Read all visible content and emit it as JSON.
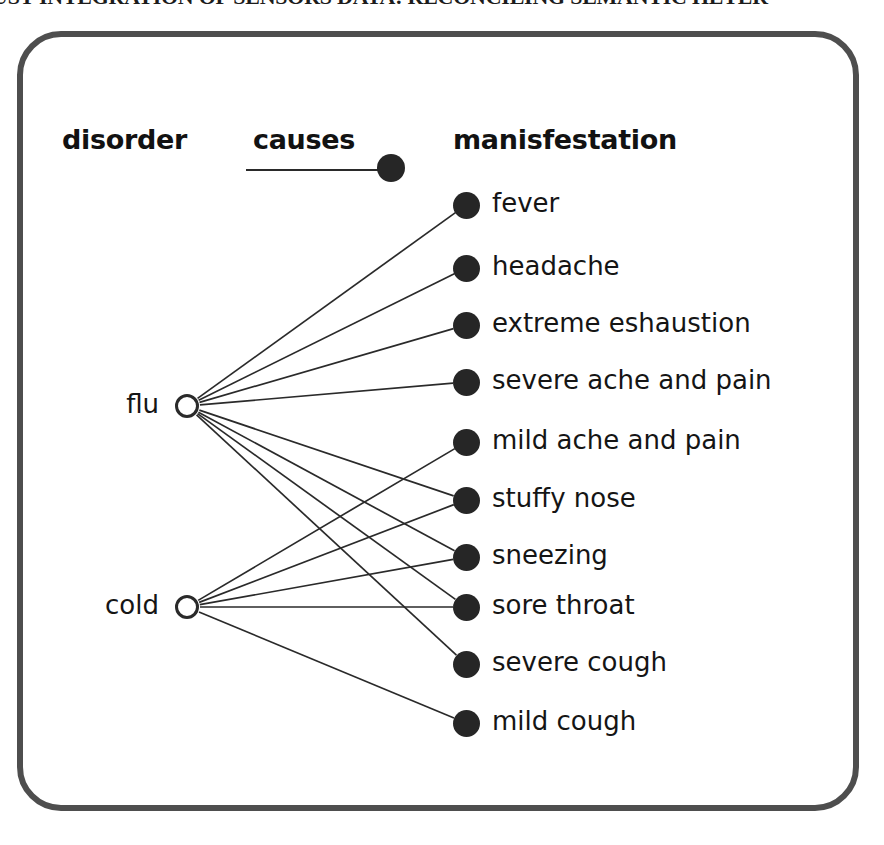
{
  "caption": {
    "text": "UST INTEGRATION OF SENSORS DATA: RECONCILING SEMANTIC HETER"
  },
  "figure": {
    "headers": {
      "disorder": "disorder",
      "causes": "causes",
      "manifestation": "manisfestation"
    },
    "legend": {
      "label": "causes",
      "edge_color": "#2a2a2a",
      "node_color": "#262626"
    },
    "colors": {
      "frame": "#4e4e4e",
      "edge": "#2a2a2a",
      "filled_node": "#262626",
      "hollow_node_stroke": "#2a2a2a",
      "text": "#151515",
      "background": "#ffffff"
    },
    "disorders": [
      {
        "id": "flu",
        "label": "flu",
        "x": 187,
        "y": 406
      },
      {
        "id": "cold",
        "label": "cold",
        "x": 187,
        "y": 607
      }
    ],
    "manifestations": [
      {
        "id": "fever",
        "label": "fever",
        "x": 466,
        "y": 205
      },
      {
        "id": "headache",
        "label": "headache",
        "x": 466,
        "y": 268
      },
      {
        "id": "extreme-eshaustion",
        "label": "extreme eshaustion",
        "x": 466,
        "y": 325
      },
      {
        "id": "severe-ache-and-pain",
        "label": "severe ache and pain",
        "x": 466,
        "y": 382
      },
      {
        "id": "mild-ache-and-pain",
        "label": "mild ache and pain",
        "x": 466,
        "y": 442
      },
      {
        "id": "stuffy-nose",
        "label": "stuffy nose",
        "x": 466,
        "y": 500
      },
      {
        "id": "sneezing",
        "label": "sneezing",
        "x": 466,
        "y": 557
      },
      {
        "id": "sore-throat",
        "label": "sore throat",
        "x": 466,
        "y": 607
      },
      {
        "id": "severe-cough",
        "label": "severe cough",
        "x": 466,
        "y": 664
      },
      {
        "id": "mild-cough",
        "label": "mild cough",
        "x": 466,
        "y": 723
      }
    ],
    "edges": [
      {
        "from": "flu",
        "to": "fever"
      },
      {
        "from": "flu",
        "to": "headache"
      },
      {
        "from": "flu",
        "to": "extreme-eshaustion"
      },
      {
        "from": "flu",
        "to": "severe-ache-and-pain"
      },
      {
        "from": "flu",
        "to": "stuffy-nose"
      },
      {
        "from": "flu",
        "to": "sneezing"
      },
      {
        "from": "flu",
        "to": "sore-throat"
      },
      {
        "from": "flu",
        "to": "severe-cough"
      },
      {
        "from": "cold",
        "to": "mild-ache-and-pain"
      },
      {
        "from": "cold",
        "to": "stuffy-nose"
      },
      {
        "from": "cold",
        "to": "sneezing"
      },
      {
        "from": "cold",
        "to": "sore-throat"
      },
      {
        "from": "cold",
        "to": "mild-cough"
      }
    ]
  }
}
